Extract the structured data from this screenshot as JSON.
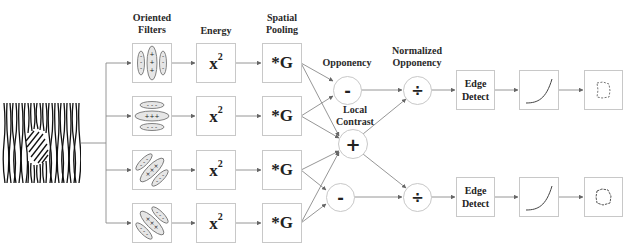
{
  "diagram": {
    "stage_labels": {
      "oriented_filters": [
        "Oriented",
        "Filters"
      ],
      "energy": "Energy",
      "spatial_pooling": [
        "Spatial",
        "Pooling"
      ],
      "opponency": "Opponency",
      "local_contrast": [
        "Local",
        "Contrast"
      ],
      "normalized_opponency": [
        "Normalized",
        "Opponency"
      ]
    },
    "input": {
      "name": "texture-image",
      "description": "oriented texture with embedded region"
    },
    "filters": [
      {
        "orientation": "vertical",
        "signs": [
          "-",
          "+",
          "-"
        ]
      },
      {
        "orientation": "horizontal",
        "signs": [
          "-",
          "+",
          "-"
        ]
      },
      {
        "orientation": "diagonal-right",
        "signs": [
          "-",
          "x",
          "-"
        ]
      },
      {
        "orientation": "diagonal-left",
        "signs": [
          "-",
          "x",
          "-"
        ]
      }
    ],
    "energy_label": "x",
    "energy_exponent": "2",
    "pooling_label": "*G",
    "opponency_top": "-",
    "local_contrast_op": "+",
    "opponency_bottom": "-",
    "divide_op": "÷",
    "edge_detect": [
      "Edge",
      "Detect"
    ],
    "colors": {
      "stroke": "#777777",
      "box_border": "#c8c8c8",
      "text": "#222222"
    }
  }
}
